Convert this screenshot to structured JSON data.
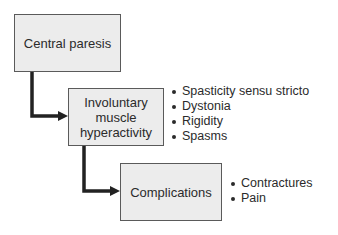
{
  "diagram": {
    "type": "flowchart",
    "colors": {
      "box_fill": "#ececec",
      "box_border": "#5a5a5a",
      "connector": "#222222",
      "text": "#2b2b2b"
    },
    "nodes": [
      {
        "id": "central-paresis",
        "lines": [
          "Central paresis"
        ]
      },
      {
        "id": "involuntary-muscle-hyperactivity",
        "lines": [
          "Involuntary",
          "muscle",
          "hyperactivity"
        ]
      },
      {
        "id": "complications",
        "lines": [
          "Complications"
        ]
      }
    ],
    "edges": [
      {
        "from": "central-paresis",
        "to": "involuntary-muscle-hyperactivity"
      },
      {
        "from": "involuntary-muscle-hyperactivity",
        "to": "complications"
      }
    ],
    "bullet_lists": {
      "hyperactivity": [
        "Spasticity sensu stricto",
        "Dystonia",
        "Rigidity",
        "Spasms"
      ],
      "complications": [
        "Contractures",
        "Pain"
      ]
    }
  }
}
